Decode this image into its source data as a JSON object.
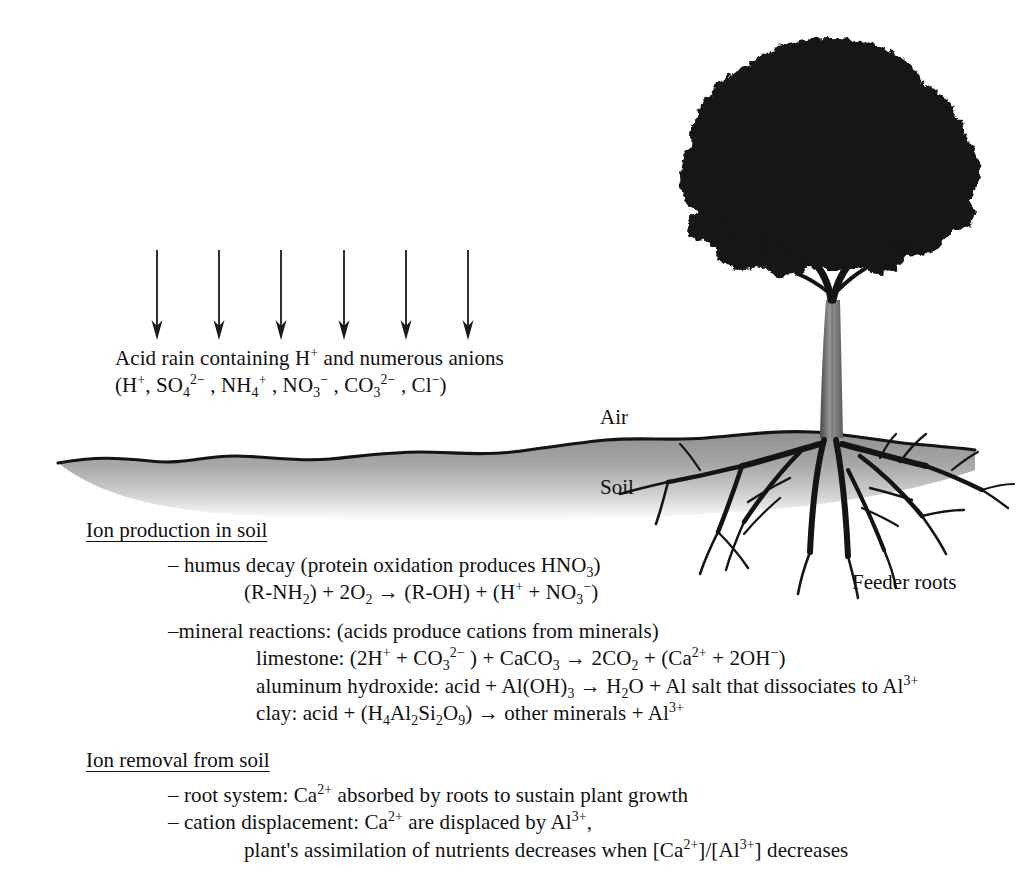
{
  "diagram": {
    "scene_labels": {
      "air": "Air",
      "soil": "Soil",
      "feeder_roots": "Feeder roots"
    },
    "rain_caption": {
      "line1": "Acid rain containing H+ and numerous anions",
      "line2": "(H+, SO42- , NH4+ , NO3- , CO32- , Cl-)"
    },
    "arrows": {
      "count": 6,
      "x_positions": [
        157,
        219,
        281,
        344,
        406,
        468
      ],
      "y_top": 250,
      "y_bottom": 338
    },
    "ground": {
      "surface_color": "#9a9a9a",
      "outline_color": "#1a1a1a",
      "left_x": 58,
      "right_x": 975,
      "surface_y": 462
    },
    "tree": {
      "canopy_color": "#151515",
      "trunk_color": "#7d7d7d",
      "root_color": "#1a1a1a"
    }
  },
  "sections": {
    "production": {
      "heading": "Ion production in soil",
      "humus": {
        "line1": "– humus decay (protein oxidation produces HNO3)",
        "line2": "(R-NH2) + 2O2 → (R-OH) + (H+ + NO3-)"
      },
      "mineral": {
        "intro": "–mineral reactions: (acids produce cations from minerals)",
        "limestone": "limestone: (2H+ + CO32- ) + CaCO3 → 2CO2 + (Ca2+ + 2OH-)",
        "aluminum": "aluminum hydroxide: acid + Al(OH)3 → H2O + Al salt that dissociates to Al3+",
        "clay": "clay: acid + (H4Al2Si2O9) → other minerals + Al3+"
      }
    },
    "removal": {
      "heading": "Ion removal from soil",
      "root_system": "– root system: Ca2+ absorbed by roots to sustain plant growth",
      "cation_displacement_line1": "– cation displacement: Ca2+ are displaced by Al3+,",
      "cation_displacement_line2": "plant's assimilation of nutrients decreases when [Ca2+]/[Al3+] decreases"
    }
  }
}
